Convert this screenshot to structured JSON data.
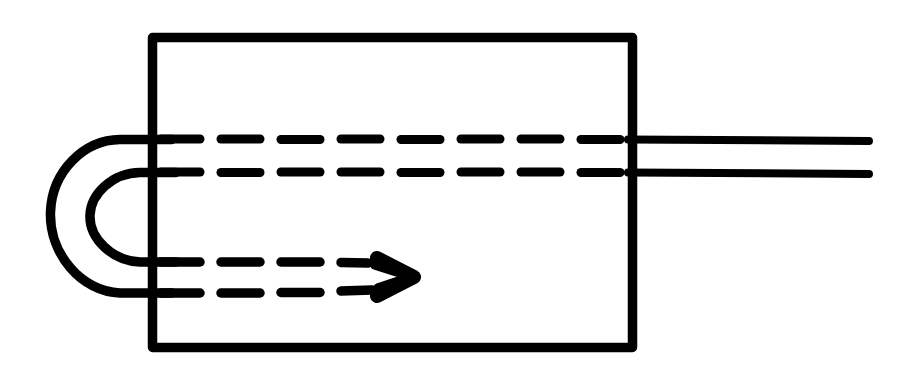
{
  "figure": {
    "title": "Hand-drawn schematic: rectangular block with looped conductor entering from the left and two leads exiting right",
    "canvas": {
      "width": 902,
      "height": 380,
      "background": "#ffffff"
    },
    "ink_color": "#000000",
    "style": "hand-drawn ink line art, no text labels",
    "elements": [
      {
        "name": "body-rectangle",
        "kind": "rectangle",
        "x": 148,
        "y": 33,
        "width": 489,
        "height": 319,
        "stroke_width": 9,
        "fill": "none"
      },
      {
        "name": "outer-loop-curve",
        "kind": "open-u-curve",
        "description": "large U / hairpin curve bulging to the left of the rectangle",
        "start": [
          168,
          139
        ],
        "end": [
          168,
          293
        ],
        "leftmost_x": 50,
        "stroke_width": 9
      },
      {
        "name": "inner-loop-curve",
        "kind": "open-u-curve",
        "description": "smaller concentric U / hairpin curve nested inside the outer loop",
        "start": [
          172,
          172
        ],
        "end": [
          172,
          262
        ],
        "leftmost_x": 90,
        "stroke_width": 9
      },
      {
        "name": "upper-dashed-line-1",
        "kind": "dashed-line",
        "y": 139,
        "x_start": 160,
        "x_end": 636,
        "dash_count": 8,
        "dash_length": 39,
        "gap_length": 21,
        "stroke_width": 9
      },
      {
        "name": "upper-dashed-line-2",
        "kind": "dashed-line",
        "y": 172,
        "x_start": 160,
        "x_end": 636,
        "dash_count": 8,
        "dash_length": 39,
        "gap_length": 21,
        "stroke_width": 9
      },
      {
        "name": "lower-dashed-arrow-line-1",
        "kind": "dashed-line-converging",
        "y": 262,
        "x_start": 160,
        "x_end": 372,
        "dash_count": 4,
        "dash_length": 39,
        "gap_length": 21,
        "stroke_width": 9
      },
      {
        "name": "lower-dashed-arrow-line-2",
        "kind": "dashed-line-converging",
        "y": 293,
        "x_start": 160,
        "x_end": 372,
        "dash_count": 4,
        "dash_length": 39,
        "gap_length": 21,
        "stroke_width": 9
      },
      {
        "name": "arrowhead-chevron",
        "kind": "arrowhead",
        "direction": "right",
        "tip": [
          416,
          277
        ],
        "top_back": [
          376,
          257
        ],
        "bottom_back": [
          376,
          297
        ],
        "stroke_width": 13
      },
      {
        "name": "right-lead-line-upper",
        "kind": "solid-line",
        "y": 139,
        "x_start": 630,
        "x_end": 872,
        "stroke_width": 8
      },
      {
        "name": "right-lead-line-lower",
        "kind": "solid-line",
        "y": 172,
        "x_start": 630,
        "x_end": 872,
        "stroke_width": 8
      }
    ]
  }
}
